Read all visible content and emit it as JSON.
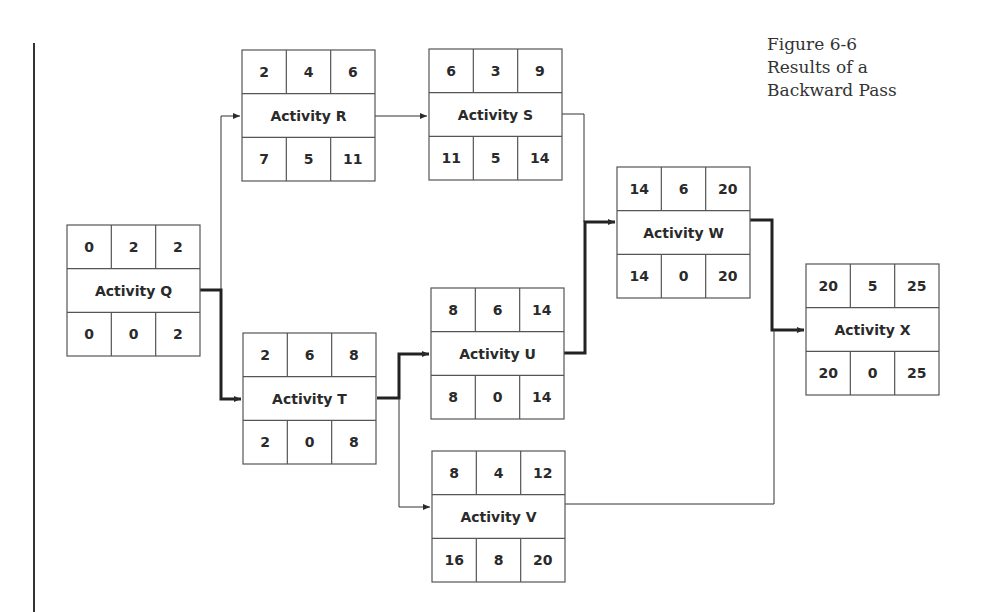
{
  "caption": {
    "line1": "Figure 6-6",
    "line2": "Results of a",
    "line3": "Backward Pass"
  },
  "nodes": [
    {
      "id": "Q",
      "name": "Activity Q",
      "top": [
        "0",
        "2",
        "2"
      ],
      "bottom": [
        "0",
        "0",
        "2"
      ],
      "x": 67,
      "y": 225
    },
    {
      "id": "R",
      "name": "Activity R",
      "top": [
        "2",
        "4",
        "6"
      ],
      "bottom": [
        "7",
        "5",
        "11"
      ],
      "x": 242,
      "y": 50
    },
    {
      "id": "S",
      "name": "Activity S",
      "top": [
        "6",
        "3",
        "9"
      ],
      "bottom": [
        "11",
        "5",
        "14"
      ],
      "x": 429,
      "y": 49
    },
    {
      "id": "T",
      "name": "Activity T",
      "top": [
        "2",
        "6",
        "8"
      ],
      "bottom": [
        "2",
        "0",
        "8"
      ],
      "x": 243,
      "y": 333
    },
    {
      "id": "U",
      "name": "Activity U",
      "top": [
        "8",
        "6",
        "14"
      ],
      "bottom": [
        "8",
        "0",
        "14"
      ],
      "x": 431,
      "y": 288
    },
    {
      "id": "V",
      "name": "Activity V",
      "top": [
        "8",
        "4",
        "12"
      ],
      "bottom": [
        "16",
        "8",
        "20"
      ],
      "x": 432,
      "y": 451
    },
    {
      "id": "W",
      "name": "Activity W",
      "top": [
        "14",
        "6",
        "20"
      ],
      "bottom": [
        "14",
        "0",
        "20"
      ],
      "x": 617,
      "y": 167
    },
    {
      "id": "X",
      "name": "Activity X",
      "top": [
        "20",
        "5",
        "25"
      ],
      "bottom": [
        "20",
        "0",
        "25"
      ],
      "x": 806,
      "y": 264
    }
  ],
  "edges": [
    {
      "from": "Q",
      "to": "R",
      "critical": false
    },
    {
      "from": "Q",
      "to": "T",
      "critical": true
    },
    {
      "from": "R",
      "to": "S",
      "critical": false
    },
    {
      "from": "S",
      "to": "W",
      "critical": false
    },
    {
      "from": "T",
      "to": "U",
      "critical": true
    },
    {
      "from": "T",
      "to": "V",
      "critical": false
    },
    {
      "from": "U",
      "to": "W",
      "critical": true
    },
    {
      "from": "W",
      "to": "X",
      "critical": true
    },
    {
      "from": "V",
      "to": "X",
      "critical": false
    }
  ],
  "colors": {
    "line": "#2a2a2a",
    "box": "#555555"
  }
}
